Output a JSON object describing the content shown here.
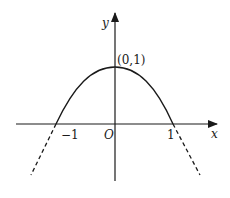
{
  "figure": {
    "type": "function-graph",
    "axes": {
      "x_label": "x",
      "y_label": "y",
      "origin_label": "O"
    },
    "ticks": {
      "neg_one": "−1",
      "pos_one": "1"
    },
    "annotations": {
      "vertex": "(0,1)"
    },
    "curve": {
      "description": "downward-opening curve through (0,1), crossing x-axis near ±1, continued as dashed lines below the axis",
      "stroke_color": "#1a1a1a"
    }
  }
}
